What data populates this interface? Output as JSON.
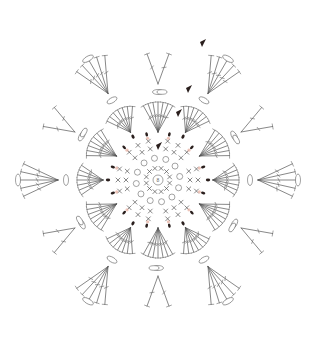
{
  "diagram": {
    "title": "",
    "type": "crochet-hexagon-chart",
    "center": [
      158,
      180
    ],
    "symmetry": 6,
    "colors": {
      "background": "#ffffff",
      "stitch_line": "#555555",
      "marker_dark": "#2a1f1d",
      "marker_pink": "#e8b5a8",
      "label": "#c9a9a0"
    },
    "center_ring": {
      "radius": 5,
      "label": "8"
    },
    "rounds": [
      {
        "id": 1,
        "type": "single-crochet",
        "radius": 16
      },
      {
        "id": 2,
        "type": "chain-loops",
        "radius": 28
      },
      {
        "id": 3,
        "type": "single-crochet-spokes",
        "radius": 45
      },
      {
        "id": 4,
        "type": "shell-fans",
        "radius": 70
      },
      {
        "id": 5,
        "type": "chain-arches",
        "radius": 95
      },
      {
        "id": 6,
        "type": "outer-fans",
        "radius": 125
      }
    ],
    "markers": [
      {
        "kind": "start-triangle",
        "round": 3
      },
      {
        "kind": "start-triangle",
        "round": 4
      },
      {
        "kind": "start-triangle",
        "round": 5
      },
      {
        "kind": "start-triangle",
        "round": 6
      }
    ],
    "legend": []
  }
}
